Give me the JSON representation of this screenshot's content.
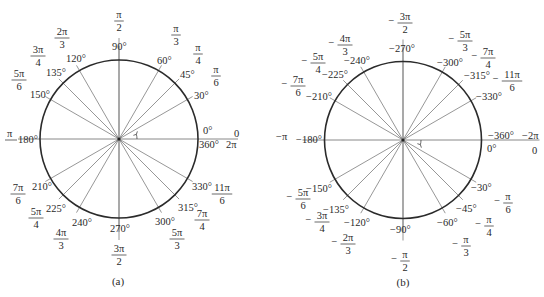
{
  "figure": {
    "panels": [
      {
        "id": "a",
        "caption": "(a)",
        "center": [
          119,
          139
        ],
        "radius": 79,
        "direction": "counterclockwise",
        "captionPos": [
          118,
          285
        ],
        "arrowAngle": 15,
        "angles": [
          0,
          30,
          45,
          60,
          90,
          120,
          135,
          150,
          180,
          210,
          225,
          240,
          270,
          300,
          315,
          330
        ],
        "degLabels": [
          {
            "text": "0°",
            "x": 203,
            "y": 134
          },
          {
            "text": "360°",
            "x": 199,
            "y": 148
          },
          {
            "text": "30°",
            "x": 194,
            "y": 99
          },
          {
            "text": "45°",
            "x": 180,
            "y": 78
          },
          {
            "text": "60°",
            "x": 157,
            "y": 64
          },
          {
            "text": "90°",
            "x": 112,
            "y": 50
          },
          {
            "text": "120°",
            "x": 66,
            "y": 62
          },
          {
            "text": "135°",
            "x": 46,
            "y": 76
          },
          {
            "text": "150°",
            "x": 30,
            "y": 98
          },
          {
            "text": "180°",
            "x": 18,
            "y": 143
          },
          {
            "text": "210°",
            "x": 32,
            "y": 190
          },
          {
            "text": "225°",
            "x": 46,
            "y": 212
          },
          {
            "text": "240°",
            "x": 72,
            "y": 226
          },
          {
            "text": "270°",
            "x": 110,
            "y": 232
          },
          {
            "text": "300°",
            "x": 155,
            "y": 225
          },
          {
            "text": "315°",
            "x": 178,
            "y": 211
          },
          {
            "text": "330°",
            "x": 192,
            "y": 190
          }
        ],
        "fracLabels": [
          {
            "num": "π",
            "den": "2",
            "x": 119,
            "y": 18
          },
          {
            "num": "π",
            "den": "3",
            "x": 176,
            "y": 32
          },
          {
            "num": "π",
            "den": "4",
            "x": 198,
            "y": 51
          },
          {
            "num": "π",
            "den": "6",
            "x": 216,
            "y": 73
          },
          {
            "num": "2π",
            "den": "3",
            "x": 62,
            "y": 35
          },
          {
            "num": "3π",
            "den": "4",
            "x": 38,
            "y": 53
          },
          {
            "num": "5π",
            "den": "6",
            "x": 19,
            "y": 77
          },
          {
            "num": "7π",
            "den": "6",
            "x": 18,
            "y": 191
          },
          {
            "num": "5π",
            "den": "4",
            "x": 36,
            "y": 215
          },
          {
            "num": "4π",
            "den": "3",
            "x": 61,
            "y": 236
          },
          {
            "num": "3π",
            "den": "2",
            "x": 119,
            "y": 252
          },
          {
            "num": "5π",
            "den": "3",
            "x": 177,
            "y": 236
          },
          {
            "num": "7π",
            "den": "4",
            "x": 202,
            "y": 217
          },
          {
            "num": "11π",
            "den": "6",
            "x": 222,
            "y": 191
          }
        ],
        "inlineLabels": [
          {
            "text": "π",
            "x": 7,
            "y": 137,
            "bar": true
          },
          {
            "text": "0",
            "x": 234,
            "y": 137
          },
          {
            "text": "2π",
            "x": 226,
            "y": 148
          }
        ]
      },
      {
        "id": "b",
        "caption": "(b)",
        "center": [
          403,
          140
        ],
        "radius": 78.5,
        "direction": "clockwise",
        "captionPos": [
          403,
          286
        ],
        "arrowAngle": -15,
        "angles": [
          0,
          -30,
          -45,
          -60,
          -90,
          -120,
          -135,
          -150,
          -180,
          -210,
          -225,
          -240,
          -270,
          -300,
          -315,
          -330
        ],
        "degLabels": [
          {
            "text": "−360°",
            "x": 488,
            "y": 139
          },
          {
            "text": "0°",
            "x": 487,
            "y": 152
          },
          {
            "text": "−330°",
            "x": 476,
            "y": 100
          },
          {
            "text": "−315°",
            "x": 464,
            "y": 79
          },
          {
            "text": "−300°",
            "x": 437,
            "y": 66
          },
          {
            "text": "−270°",
            "x": 389,
            "y": 52
          },
          {
            "text": "−240°",
            "x": 344,
            "y": 64
          },
          {
            "text": "−225°",
            "x": 322,
            "y": 78
          },
          {
            "text": "−210°",
            "x": 306,
            "y": 100
          },
          {
            "text": "−180°",
            "x": 296,
            "y": 143
          },
          {
            "text": "−150°",
            "x": 306,
            "y": 192
          },
          {
            "text": "−135°",
            "x": 323,
            "y": 213
          },
          {
            "text": "−120°",
            "x": 344,
            "y": 226
          },
          {
            "text": "−90°",
            "x": 390,
            "y": 233
          },
          {
            "text": "−60°",
            "x": 437,
            "y": 226
          },
          {
            "text": "−45°",
            "x": 456,
            "y": 212
          },
          {
            "text": "−30°",
            "x": 471,
            "y": 191
          }
        ],
        "fracLabels": [
          {
            "num": "3π",
            "den": "2",
            "x": 405,
            "y": 20,
            "neg": true
          },
          {
            "num": "5π",
            "den": "3",
            "x": 465,
            "y": 38,
            "neg": true
          },
          {
            "num": "7π",
            "den": "4",
            "x": 488,
            "y": 55,
            "neg": true
          },
          {
            "num": "11π",
            "den": "6",
            "x": 512,
            "y": 78,
            "neg": true
          },
          {
            "num": "4π",
            "den": "3",
            "x": 345,
            "y": 42,
            "neg": true
          },
          {
            "num": "5π",
            "den": "4",
            "x": 318,
            "y": 60,
            "neg": true
          },
          {
            "num": "7π",
            "den": "6",
            "x": 298,
            "y": 83,
            "neg": true
          },
          {
            "num": "5π",
            "den": "6",
            "x": 303,
            "y": 196,
            "neg": true
          },
          {
            "num": "3π",
            "den": "4",
            "x": 322,
            "y": 219,
            "neg": true
          },
          {
            "num": "2π",
            "den": "3",
            "x": 348,
            "y": 241,
            "neg": true
          },
          {
            "num": "π",
            "den": "2",
            "x": 405,
            "y": 258,
            "neg": true
          },
          {
            "num": "π",
            "den": "3",
            "x": 466,
            "y": 243,
            "neg": true
          },
          {
            "num": "π",
            "den": "4",
            "x": 489,
            "y": 223,
            "neg": true
          },
          {
            "num": "π",
            "den": "6",
            "x": 508,
            "y": 200,
            "neg": true
          }
        ],
        "inlineLabels": [
          {
            "text": "−π",
            "x": 276,
            "y": 140
          },
          {
            "text": "−2π",
            "x": 522,
            "y": 139
          },
          {
            "text": "0",
            "x": 532,
            "y": 154
          }
        ]
      }
    ]
  }
}
